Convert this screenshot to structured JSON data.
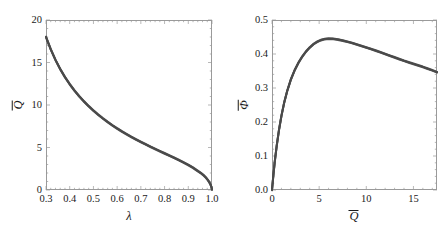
{
  "figure": {
    "background": "#ffffff",
    "curve_color": "#4a4a4a",
    "frame_color": "#9a9a9a",
    "panel_count": 2
  },
  "chart_data": [
    {
      "type": "line",
      "panel": "left",
      "title": "",
      "xlabel": "λ",
      "ylabel": "Q̄",
      "xlim": [
        0.3,
        1.0
      ],
      "ylim": [
        0,
        20
      ],
      "xticks": [
        0.3,
        0.4,
        0.5,
        0.6,
        0.7,
        0.8,
        0.9,
        1.0
      ],
      "xticklabels": [
        "0.3",
        "0.4",
        "0.5",
        "0.6",
        "0.7",
        "0.8",
        "0.9",
        "1.0"
      ],
      "yticks": [
        0,
        5,
        10,
        15,
        20
      ],
      "yticklabels": [
        "0",
        "5",
        "10",
        "15",
        "20"
      ],
      "minor_ticks": true,
      "grid": false,
      "legend": null,
      "series": [
        {
          "name": "Q̄(λ)",
          "color": "#4a4a4a",
          "linewidth": 2.0,
          "x": [
            0.3,
            0.32,
            0.34,
            0.36,
            0.38,
            0.4,
            0.42,
            0.44,
            0.46,
            0.48,
            0.5,
            0.52,
            0.54,
            0.56,
            0.58,
            0.6,
            0.62,
            0.64,
            0.66,
            0.68,
            0.7,
            0.72,
            0.74,
            0.76,
            0.78,
            0.8,
            0.82,
            0.84,
            0.86,
            0.88,
            0.9,
            0.92,
            0.94,
            0.955,
            0.965,
            0.975,
            0.982,
            0.988,
            0.993,
            0.997,
            1.0
          ],
          "y": [
            18.0,
            16.55,
            15.3,
            14.22,
            13.28,
            12.45,
            11.7,
            11.03,
            10.42,
            9.86,
            9.34,
            8.86,
            8.42,
            8.0,
            7.61,
            7.24,
            6.89,
            6.56,
            6.24,
            5.94,
            5.65,
            5.37,
            5.1,
            4.83,
            4.57,
            4.31,
            4.05,
            3.79,
            3.52,
            3.24,
            2.95,
            2.62,
            2.24,
            1.95,
            1.72,
            1.44,
            1.19,
            0.94,
            0.68,
            0.4,
            0.05
          ]
        }
      ]
    },
    {
      "type": "line",
      "panel": "right",
      "title": "",
      "xlabel": "Q̄",
      "ylabel": "Φ̄",
      "xlim": [
        0,
        17.5
      ],
      "ylim": [
        0.0,
        0.5
      ],
      "xticks": [
        0,
        5,
        10,
        15
      ],
      "xticklabels": [
        "0",
        "5",
        "10",
        "15"
      ],
      "yticks": [
        0.0,
        0.1,
        0.2,
        0.3,
        0.4,
        0.5
      ],
      "yticklabels": [
        "0.0",
        "0.1",
        "0.2",
        "0.3",
        "0.4",
        "0.5"
      ],
      "minor_ticks": true,
      "grid": false,
      "legend": null,
      "series": [
        {
          "name": "Φ̄(Q̄)",
          "color": "#4a4a4a",
          "linewidth": 2.0,
          "x": [
            0.0,
            0.15,
            0.3,
            0.5,
            0.75,
            1.0,
            1.3,
            1.6,
            2.0,
            2.4,
            2.8,
            3.2,
            3.6,
            4.0,
            4.4,
            4.8,
            5.2,
            5.6,
            6.0,
            6.5,
            7.0,
            7.5,
            8.0,
            8.5,
            9.0,
            9.5,
            10.0,
            10.5,
            11.0,
            11.5,
            12.0,
            12.5,
            13.0,
            13.5,
            14.0,
            14.5,
            15.0,
            15.5,
            16.0,
            16.5,
            17.0,
            17.5
          ],
          "y": [
            0.0,
            0.045,
            0.085,
            0.13,
            0.178,
            0.218,
            0.258,
            0.29,
            0.325,
            0.352,
            0.374,
            0.392,
            0.407,
            0.419,
            0.429,
            0.436,
            0.441,
            0.444,
            0.445,
            0.4445,
            0.4425,
            0.4395,
            0.436,
            0.4325,
            0.428,
            0.4235,
            0.419,
            0.4145,
            0.41,
            0.405,
            0.4,
            0.395,
            0.39,
            0.385,
            0.38,
            0.3755,
            0.371,
            0.3665,
            0.362,
            0.357,
            0.352,
            0.3465
          ]
        }
      ]
    }
  ]
}
